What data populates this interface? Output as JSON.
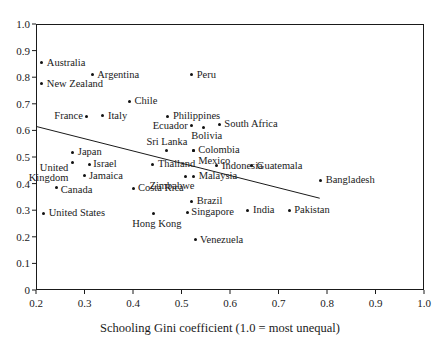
{
  "chart_data": {
    "type": "scatter",
    "title": "",
    "xlabel": "Schooling Gini coefficient (1.0 = most unequal)",
    "ylabel": "",
    "xlim": [
      0.2,
      1.0
    ],
    "ylim": [
      0.0,
      1.0
    ],
    "grid": false,
    "legend": null,
    "xticks": [
      "0.2",
      "0.3",
      "0.4",
      "0.5",
      "0.6",
      "0.7",
      "0.8",
      "0.9",
      "1.0"
    ],
    "xtick_values": [
      0.2,
      0.3,
      0.4,
      0.5,
      0.6,
      0.7,
      0.8,
      0.9,
      1.0
    ],
    "yticks": [
      "0",
      "0.1",
      "0.2",
      "0.3",
      "0.4",
      "0.5",
      "0.6",
      "0.7",
      "0.8",
      "0.9",
      "1.0"
    ],
    "ytick_values": [
      0.0,
      0.1,
      0.2,
      0.3,
      0.4,
      0.5,
      0.6,
      0.7,
      0.8,
      0.9,
      1.0
    ],
    "trendline": {
      "x": [
        0.2,
        0.785
      ],
      "y": [
        0.615,
        0.345
      ]
    },
    "points": [
      {
        "label": "Australia",
        "x": 0.212,
        "y": 0.855,
        "anchor": "right",
        "dx": 5,
        "dy": 0
      },
      {
        "label": "New Zealand",
        "x": 0.212,
        "y": 0.776,
        "anchor": "right",
        "dx": 5,
        "dy": 0
      },
      {
        "label": "Argentina",
        "x": 0.316,
        "y": 0.81,
        "anchor": "right",
        "dx": 5,
        "dy": 0
      },
      {
        "label": "Peru",
        "x": 0.521,
        "y": 0.81,
        "anchor": "right",
        "dx": 5,
        "dy": 0
      },
      {
        "label": "Chile",
        "x": 0.393,
        "y": 0.71,
        "anchor": "right",
        "dx": 5,
        "dy": 0
      },
      {
        "label": "France",
        "x": 0.305,
        "y": 0.654,
        "anchor": "left",
        "dx": -4,
        "dy": 0
      },
      {
        "label": "Italy",
        "x": 0.338,
        "y": 0.656,
        "anchor": "right",
        "dx": 5,
        "dy": 0
      },
      {
        "label": "Philippines",
        "x": 0.472,
        "y": 0.653,
        "anchor": "right",
        "dx": 5,
        "dy": 0
      },
      {
        "label": "South Africa",
        "x": 0.578,
        "y": 0.622,
        "anchor": "right",
        "dx": 5,
        "dy": -1
      },
      {
        "label": "Ecuador",
        "x": 0.521,
        "y": 0.618,
        "anchor": "left",
        "dx": -4,
        "dy": 0
      },
      {
        "label": "Bolivia",
        "x": 0.546,
        "y": 0.612,
        "anchor": "center",
        "dx": 3,
        "dy": 9
      },
      {
        "label": "Sri Lanka",
        "x": 0.47,
        "y": 0.525,
        "anchor": "center",
        "dx": 0,
        "dy": -8
      },
      {
        "label": "Colombia",
        "x": 0.524,
        "y": 0.523,
        "anchor": "right",
        "dx": 5,
        "dy": -1
      },
      {
        "label": "Mexico",
        "x": 0.524,
        "y": 0.523,
        "anchor": "right",
        "dx": 5,
        "dy": 10
      },
      {
        "label": "Japan",
        "x": 0.276,
        "y": 0.517,
        "anchor": "right",
        "dx": 5,
        "dy": 0
      },
      {
        "label": "United\nKingdom",
        "x": 0.275,
        "y": 0.478,
        "anchor": "left",
        "dx": -4,
        "dy": 5
      },
      {
        "label": "Israel",
        "x": 0.31,
        "y": 0.473,
        "anchor": "right",
        "dx": 4,
        "dy": 0
      },
      {
        "label": "Thailand",
        "x": 0.441,
        "y": 0.472,
        "anchor": "right",
        "dx": 5,
        "dy": 0
      },
      {
        "label": "Indonesia",
        "x": 0.573,
        "y": 0.468,
        "anchor": "right",
        "dx": 5,
        "dy": 0
      },
      {
        "label": "Guatemala",
        "x": 0.645,
        "y": 0.468,
        "anchor": "right",
        "dx": 5,
        "dy": 0
      },
      {
        "label": "Jamaica",
        "x": 0.301,
        "y": 0.432,
        "anchor": "right",
        "dx": 4,
        "dy": 1
      },
      {
        "label": "Malaysia",
        "x": 0.525,
        "y": 0.427,
        "anchor": "right",
        "dx": 5,
        "dy": 0
      },
      {
        "label": "Zimbabwe",
        "x": 0.508,
        "y": 0.427,
        "anchor": "left",
        "dx": 9,
        "dy": 10
      },
      {
        "label": "Bangladesh",
        "x": 0.787,
        "y": 0.413,
        "anchor": "right",
        "dx": 5,
        "dy": 0
      },
      {
        "label": "Canada",
        "x": 0.243,
        "y": 0.385,
        "anchor": "right",
        "dx": 4,
        "dy": 2
      },
      {
        "label": "Costa Rica",
        "x": 0.4,
        "y": 0.382,
        "anchor": "right",
        "dx": 5,
        "dy": 0
      },
      {
        "label": "Brazil",
        "x": 0.521,
        "y": 0.333,
        "anchor": "right",
        "dx": 5,
        "dy": 0
      },
      {
        "label": "India",
        "x": 0.637,
        "y": 0.3,
        "anchor": "right",
        "dx": 5,
        "dy": 0
      },
      {
        "label": "Pakistan",
        "x": 0.722,
        "y": 0.3,
        "anchor": "right",
        "dx": 5,
        "dy": 0
      },
      {
        "label": "Singapore",
        "x": 0.512,
        "y": 0.292,
        "anchor": "right",
        "dx": 4,
        "dy": 0
      },
      {
        "label": "United States",
        "x": 0.216,
        "y": 0.288,
        "anchor": "right",
        "dx": 5,
        "dy": 0
      },
      {
        "label": "Hong Kong",
        "x": 0.443,
        "y": 0.288,
        "anchor": "center",
        "dx": 3,
        "dy": 11
      },
      {
        "label": "Venezuela",
        "x": 0.528,
        "y": 0.188,
        "anchor": "right",
        "dx": 5,
        "dy": 0
      }
    ]
  }
}
